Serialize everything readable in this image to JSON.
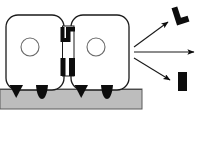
{
  "figure": {
    "title": "",
    "canvas": {
      "width": 206,
      "height": 145,
      "background": "#ffffff"
    },
    "ground": {
      "name": "ground-strip",
      "x": 0,
      "y": 89,
      "width": 142,
      "height": 20,
      "fill": "#bdbdbd",
      "stroke": "#555555"
    },
    "vehicles": [
      {
        "name": "left-module",
        "body": {
          "x": 6,
          "y": 15,
          "width": 58,
          "height": 75,
          "radius": 12,
          "fill": "#ffffff",
          "stroke": "#1a1a1a"
        },
        "port": {
          "cx": 30,
          "cy": 47,
          "r": 9,
          "fill": "#ffffff",
          "stroke": "#555555"
        },
        "feet": [
          {
            "name": "wedge-foot",
            "shape": "triangle",
            "cx": 16,
            "cy": 90,
            "width": 13,
            "height": 13,
            "fill": "#0d0d0d"
          },
          {
            "name": "blob-foot",
            "shape": "blob",
            "cx": 42,
            "cy": 90,
            "width": 12,
            "height": 14,
            "fill": "#0d0d0d"
          }
        ]
      },
      {
        "name": "right-module",
        "body": {
          "x": 71,
          "y": 15,
          "width": 58,
          "height": 75,
          "radius": 12,
          "fill": "#ffffff",
          "stroke": "#1a1a1a"
        },
        "port": {
          "cx": 96,
          "cy": 47,
          "r": 9,
          "fill": "#ffffff",
          "stroke": "#555555"
        },
        "feet": [
          {
            "name": "wedge-foot",
            "shape": "triangle",
            "cx": 81,
            "cy": 90,
            "width": 13,
            "height": 13,
            "fill": "#0d0d0d"
          },
          {
            "name": "blob-foot",
            "shape": "blob",
            "cx": 107,
            "cy": 90,
            "width": 12,
            "height": 14,
            "fill": "#0d0d0d"
          }
        ]
      }
    ],
    "coupling": {
      "name": "coupling-assembly",
      "channel": {
        "x": 62,
        "y": 26,
        "width": 12,
        "height": 50,
        "fill": "#ffffff",
        "stroke": "#1a1a1a"
      },
      "upper_latch": {
        "name": "upper-latch-l-glyph",
        "fill": "#0d0d0d"
      },
      "lower_latch": {
        "name": "lower-latch-bars",
        "fill": "#0d0d0d"
      }
    },
    "arrows": [
      {
        "name": "arrow-upper",
        "direction": "up-right",
        "x1": 134,
        "y1": 48,
        "x2": 171,
        "y2": 20,
        "stroke": "#1a1a1a",
        "target": "l-block"
      },
      {
        "name": "arrow-middle",
        "direction": "right",
        "x1": 134,
        "y1": 52,
        "x2": 196,
        "y2": 52,
        "stroke": "#1a1a1a",
        "target": "none"
      },
      {
        "name": "arrow-lower",
        "direction": "down-right",
        "x1": 134,
        "y1": 57,
        "x2": 172,
        "y2": 81,
        "stroke": "#1a1a1a",
        "target": "bar-block"
      }
    ],
    "result_shapes": [
      {
        "name": "l-block-shape",
        "kind": "rotated-l",
        "cx": 180,
        "cy": 15,
        "rotation": -20,
        "fill": "#0d0d0d"
      },
      {
        "name": "bar-block-shape",
        "kind": "vertical-bar",
        "x": 178,
        "y": 73,
        "width": 9,
        "height": 18,
        "fill": "#0d0d0d"
      }
    ],
    "labels": []
  }
}
